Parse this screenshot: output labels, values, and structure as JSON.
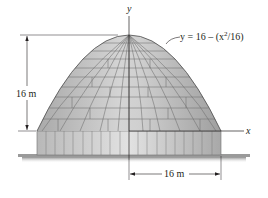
{
  "figure": {
    "axes": {
      "y_label": "y",
      "x_label": "x"
    },
    "curve_label": "y = 16 – (x²/16)",
    "curve_equation": {
      "prefix": "y = 16 – (x",
      "sup": "2",
      "suffix": "/16)"
    },
    "dimensions": {
      "height_label": "16 m",
      "half_width_label": "16 m"
    },
    "colors": {
      "dome_fill": "#c9c9c9",
      "dome_tile_line": "#6e6e6e",
      "drum_fill": "#d6d6d6",
      "ground": "#9a9a9a",
      "line": "#231f20"
    }
  }
}
